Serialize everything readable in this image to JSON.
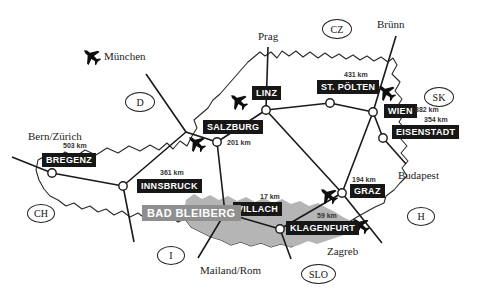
{
  "map": {
    "highlight_city": {
      "label": "BAD BLEIBERG"
    },
    "cities": {
      "bregenz": {
        "label": "BREGENZ"
      },
      "innsbruck": {
        "label": "INNSBRUCK",
        "distance": "361 km"
      },
      "salzburg": {
        "label": "SALZBURG",
        "distance": "201 km"
      },
      "linz": {
        "label": "LINZ"
      },
      "st_poelten": {
        "label": "ST. PÖLTEN",
        "distance": "431 km"
      },
      "wien": {
        "label": "WIEN",
        "distance": "382 km"
      },
      "eisenstadt": {
        "label": "EISENSTADT",
        "distance": "354 km"
      },
      "graz": {
        "label": "GRAZ",
        "distance": "194 km"
      },
      "klagenfurt": {
        "label": "KLAGENFURT",
        "distance": "59 km"
      },
      "villach": {
        "label": "VILLACH",
        "distance": "17 km"
      }
    },
    "external_cities": {
      "muenchen": {
        "label": "München"
      },
      "bern_zuerich": {
        "label": "Bern/Zürich",
        "distance": "503 km"
      },
      "prag": {
        "label": "Prag"
      },
      "bruenn": {
        "label": "Brünn"
      },
      "budapest": {
        "label": "Budapest"
      },
      "zagreb": {
        "label": "Zagreb"
      },
      "mailand_rom": {
        "label": "Mailand/Rom"
      }
    },
    "country_codes": {
      "d": "D",
      "cz": "CZ",
      "sk": "SK",
      "h": "H",
      "slo": "SLO",
      "i": "I",
      "ch": "CH"
    },
    "colors": {
      "background": "#ffffff",
      "city_box_bg": "#171717",
      "city_box_text": "#ffffff",
      "highlight_box_bg": "#8f8f8f",
      "highlight_region": "#b5b5b5",
      "border_line": "#2a2a2a",
      "road_line": "#1a1a1a"
    }
  }
}
